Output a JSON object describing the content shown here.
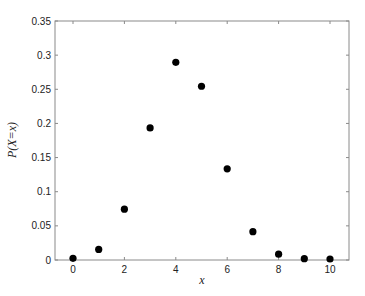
{
  "chart_data": {
    "type": "scatter",
    "title": "",
    "xlabel": "x",
    "ylabel": "P(X=x)",
    "xlim": [
      -1,
      10.8
    ],
    "ylim": [
      0,
      0.35
    ],
    "xticks": [
      0,
      2,
      4,
      6,
      8,
      10
    ],
    "xtick_labels": [
      "0",
      "2",
      "4",
      "6",
      "8",
      "10"
    ],
    "yticks": [
      0,
      0.05,
      0.1,
      0.15,
      0.2,
      0.25,
      0.3,
      0.35
    ],
    "ytick_labels": [
      "0",
      "0.05",
      "0.1",
      "0.15",
      "0.2",
      "0.25",
      "0.3",
      "0.35"
    ],
    "grid": false,
    "legend": null,
    "series": [
      {
        "name": "P(X=x)",
        "marker": "filled-circle",
        "color": "#000000",
        "x": [
          0,
          1,
          2,
          3,
          4,
          5,
          6,
          7,
          8,
          9,
          10
        ],
        "y": [
          0.001,
          0.014,
          0.073,
          0.192,
          0.288,
          0.253,
          0.132,
          0.04,
          0.007,
          0.0005,
          0.0
        ]
      }
    ]
  },
  "style": {
    "axis_color": "#8a8a8a",
    "marker_color": "#000000",
    "text_color": "#222222"
  }
}
